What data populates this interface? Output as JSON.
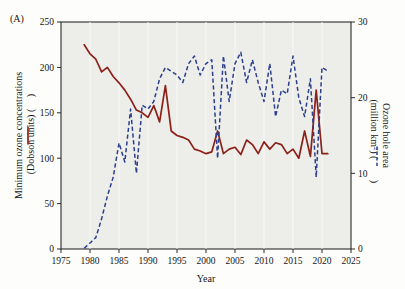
{
  "figure": {
    "panel_label": "(A)",
    "background_color": "#ededea",
    "page_background": "#fdfdfb"
  },
  "chart_data": {
    "type": "line",
    "title": "",
    "xlabel": "Year",
    "grid": true,
    "legend_position": "axis-labels",
    "xlim": [
      1975,
      2025
    ],
    "xticks": [
      1975,
      1980,
      1985,
      1990,
      1995,
      2000,
      2005,
      2010,
      2015,
      2020,
      2025
    ],
    "xticklabels": [
      "1975",
      "1980",
      "1985",
      "1990",
      "1995",
      "2000",
      "2005",
      "2010",
      "2015",
      "2020",
      "2025"
    ],
    "axes": [
      {
        "id": "left",
        "label": "Minimum ozone concentrations (Dobson units) (—)",
        "label_line1": "Minimum ozone concentrations",
        "label_line2": "(Dobson units) (",
        "label_line2_end": ")",
        "ylim": [
          0,
          250
        ],
        "yticks": [
          0,
          50,
          100,
          150,
          200,
          250
        ],
        "yticklabels": [
          "0",
          "50",
          "100",
          "150",
          "200",
          "250"
        ],
        "color": "#8c2118"
      },
      {
        "id": "right",
        "label": "Ozone hole area (million km²) (- - -)",
        "label_line1": "Ozone hole area",
        "label_line2": "(million km",
        "label_line2_sup": "2",
        "label_line2_end": ") (",
        "label_line2_tail": ")",
        "ylim": [
          0,
          30
        ],
        "yticks": [
          0,
          10,
          20,
          30
        ],
        "yticklabels": [
          "0",
          "10",
          "20",
          "30"
        ],
        "color": "#2b3f8c"
      }
    ],
    "series": [
      {
        "name": "Minimum ozone concentrations (Dobson units)",
        "axis": "left",
        "style": "solid",
        "color": "#8c2118",
        "x": [
          1979,
          1980,
          1981,
          1982,
          1983,
          1984,
          1985,
          1986,
          1987,
          1988,
          1989,
          1990,
          1991,
          1992,
          1993,
          1994,
          1995,
          1996,
          1997,
          1998,
          1999,
          2000,
          2001,
          2002,
          2003,
          2004,
          2005,
          2006,
          2007,
          2008,
          2009,
          2010,
          2011,
          2012,
          2013,
          2014,
          2015,
          2016,
          2017,
          2018,
          2019,
          2020,
          2021
        ],
        "y": [
          225,
          215,
          209,
          195,
          200,
          190,
          183,
          175,
          165,
          153,
          150,
          145,
          158,
          140,
          180,
          130,
          125,
          123,
          120,
          110,
          108,
          105,
          107,
          130,
          105,
          110,
          112,
          104,
          120,
          115,
          105,
          118,
          110,
          117,
          115,
          105,
          110,
          100,
          130,
          102,
          175,
          105,
          105
        ],
        "ylabel": "Minimum ozone concentrations (Dobson units)"
      },
      {
        "name": "Ozone hole area (million km2)",
        "axis": "right",
        "style": "dashed",
        "color": "#2b3f8c",
        "x": [
          1979,
          1980,
          1981,
          1982,
          1983,
          1984,
          1985,
          1986,
          1987,
          1988,
          1989,
          1990,
          1991,
          1992,
          1993,
          1994,
          1995,
          1996,
          1997,
          1998,
          1999,
          2000,
          2001,
          2002,
          2003,
          2004,
          2005,
          2006,
          2007,
          2008,
          2009,
          2010,
          2011,
          2012,
          2013,
          2014,
          2015,
          2016,
          2017,
          2018,
          2019,
          2020,
          2021
        ],
        "y": [
          0.1,
          0.8,
          1.5,
          4.0,
          7.0,
          9.5,
          14.0,
          11.5,
          18.5,
          10.0,
          19.0,
          18.5,
          19.5,
          22.5,
          24.0,
          23.5,
          23.0,
          22.0,
          24.5,
          25.5,
          23.0,
          24.5,
          25.0,
          12.0,
          25.5,
          19.5,
          24.5,
          26.0,
          22.0,
          25.0,
          22.0,
          19.5,
          24.5,
          17.5,
          21.0,
          20.5,
          25.5,
          20.0,
          17.5,
          22.5,
          9.5,
          24.0,
          23.5
        ],
        "ylabel": "Ozone hole area (million km2)"
      }
    ]
  }
}
